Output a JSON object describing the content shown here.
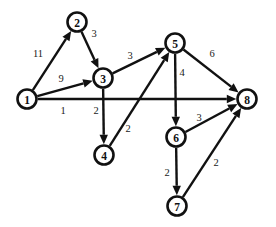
{
  "diagram": {
    "type": "directed-weighted-graph",
    "title": "",
    "width": 276,
    "height": 227,
    "background_color": "#ffffff",
    "stroke_color": "#111111",
    "node_radius": 9.5,
    "nodes": [
      {
        "id": "1",
        "label": "1",
        "x": 27,
        "y": 99
      },
      {
        "id": "2",
        "label": "2",
        "x": 77,
        "y": 22
      },
      {
        "id": "3",
        "label": "3",
        "x": 103,
        "y": 78
      },
      {
        "id": "4",
        "label": "4",
        "x": 104,
        "y": 155
      },
      {
        "id": "5",
        "label": "5",
        "x": 175,
        "y": 43
      },
      {
        "id": "6",
        "label": "6",
        "x": 176,
        "y": 137
      },
      {
        "id": "7",
        "label": "7",
        "x": 177,
        "y": 206
      },
      {
        "id": "8",
        "label": "8",
        "x": 247,
        "y": 99
      }
    ],
    "edges": [
      {
        "from": "1",
        "to": "2",
        "weight": "11",
        "lx": 38,
        "ly": 53
      },
      {
        "from": "2",
        "to": "3",
        "weight": "3",
        "lx": 94,
        "ly": 33
      },
      {
        "from": "1",
        "to": "3",
        "weight": "9",
        "lx": 61,
        "ly": 78
      },
      {
        "from": "1",
        "to": "8",
        "weight": "1",
        "lx": 63,
        "ly": 110
      },
      {
        "from": "3",
        "to": "4",
        "weight": "2",
        "lx": 96,
        "ly": 110
      },
      {
        "from": "4",
        "to": "5",
        "weight": "2",
        "lx": 128,
        "ly": 128
      },
      {
        "from": "3",
        "to": "5",
        "weight": "3",
        "lx": 130,
        "ly": 55
      },
      {
        "from": "5",
        "to": "8",
        "weight": "6",
        "lx": 212,
        "ly": 53
      },
      {
        "from": "5",
        "to": "6",
        "weight": "4",
        "lx": 182,
        "ly": 72
      },
      {
        "from": "6",
        "to": "8",
        "weight": "3",
        "lx": 199,
        "ly": 117
      },
      {
        "from": "6",
        "to": "7",
        "weight": "2",
        "lx": 167,
        "ly": 172
      },
      {
        "from": "7",
        "to": "8",
        "weight": "2",
        "lx": 216,
        "ly": 162
      }
    ]
  }
}
